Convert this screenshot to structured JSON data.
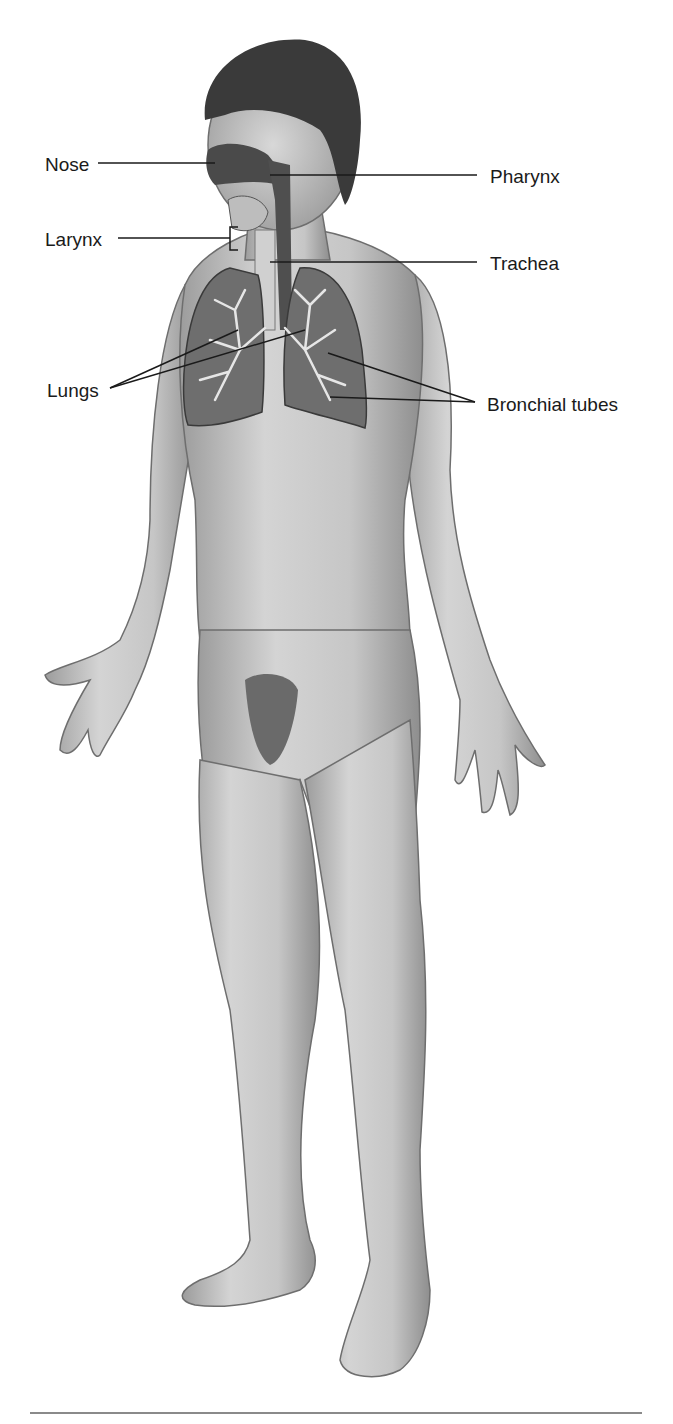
{
  "figure": {
    "labels": [
      {
        "id": "nose",
        "text": "Nose"
      },
      {
        "id": "pharynx",
        "text": "Pharynx"
      },
      {
        "id": "larynx",
        "text": "Larynx"
      },
      {
        "id": "trachea",
        "text": "Trachea"
      },
      {
        "id": "lungs",
        "text": "Lungs"
      },
      {
        "id": "bronchial_tubes",
        "text": "Bronchial tubes"
      }
    ]
  },
  "colors": {
    "background": "#ffffff",
    "skin": "#c9c9c9",
    "skin_shadow": "#9a9a9a",
    "hair": "#3a3a3a",
    "airway": "#555555",
    "lung": "#6e6e6e",
    "bronchi": "#e0e0e0",
    "leader_line": "#1a1a1a"
  }
}
